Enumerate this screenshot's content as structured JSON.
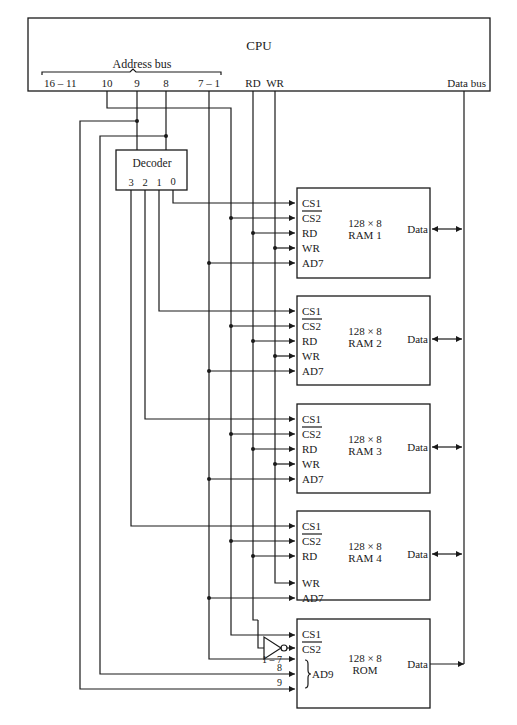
{
  "cpu": {
    "label": "CPU",
    "address_bus_label": "Address bus",
    "pins": {
      "a16_11": "16 – 11",
      "a10": "10",
      "a9": "9",
      "a8": "8",
      "a7_1": "7 – 1",
      "rd": "RD",
      "wr": "WR",
      "data_bus": "Data bus"
    }
  },
  "decoder": {
    "label": "Decoder",
    "outputs": [
      "3",
      "2",
      "1",
      "0"
    ]
  },
  "chips": [
    {
      "size": "128 × 8",
      "name": "RAM 1",
      "pins": [
        "CS1",
        "CS2",
        "RD",
        "WR",
        "AD7"
      ],
      "data": "Data"
    },
    {
      "size": "128 × 8",
      "name": "RAM 2",
      "pins": [
        "CS1",
        "CS2",
        "RD",
        "WR",
        "AD7"
      ],
      "data": "Data"
    },
    {
      "size": "128 × 8",
      "name": "RAM 3",
      "pins": [
        "CS1",
        "CS2",
        "RD",
        "WR",
        "AD7"
      ],
      "data": "Data"
    },
    {
      "size": "128 × 8",
      "name": "RAM 4",
      "pins": [
        "CS1",
        "CS2",
        "RD",
        "WR",
        "AD7"
      ],
      "data": "Data"
    }
  ],
  "rom": {
    "size": "128 × 8",
    "name": "ROM",
    "pins": [
      "CS1",
      "CS2"
    ],
    "address_label": "AD9",
    "address_lines": [
      "1 – 7",
      "8",
      "9"
    ],
    "data": "Data"
  }
}
